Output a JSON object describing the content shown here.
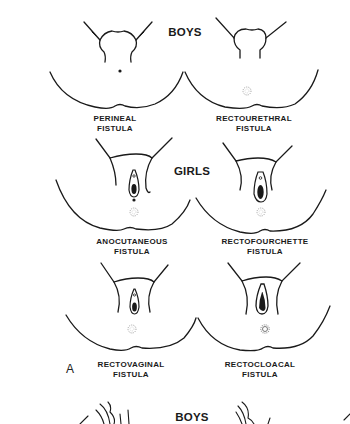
{
  "figure": {
    "panel_letter": "A",
    "sections": [
      {
        "heading": "BOYS",
        "diagrams": [
          {
            "line1": "PERINEAL",
            "line2": "FISTULA"
          },
          {
            "line1": "RECTOURETHRAL",
            "line2": "FISTULA"
          }
        ]
      },
      {
        "heading": "GIRLS",
        "diagrams": [
          {
            "line1": "ANOCUTANEOUS",
            "line2": "FISTULA"
          },
          {
            "line1": "RECTOFOURCHETTE",
            "line2": "FISTULA"
          }
        ]
      },
      {
        "heading": "",
        "diagrams": [
          {
            "line1": "RECTOVAGINAL",
            "line2": "FISTULA"
          },
          {
            "line1": "RECTOCLOACAL",
            "line2": "FISTULA"
          }
        ]
      }
    ],
    "next_panel_heading": "BOYS"
  },
  "colors": {
    "ink": "#1a1a1a",
    "stipple": "#9a9a9a",
    "background": "#ffffff"
  }
}
